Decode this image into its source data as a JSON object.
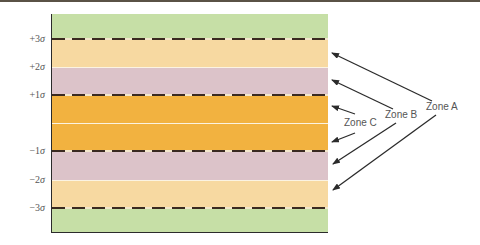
{
  "diagram": {
    "type": "control-chart-zones",
    "colors": {
      "outer": "#c6dfa6",
      "zone_a": "#f7d9a1",
      "zone_b": "#dcc3c9",
      "zone_c": "#f2b240",
      "dashed_line": "#3a2a20",
      "text": "#555555"
    },
    "y_labels": [
      {
        "prefix": "+3",
        "sigma": "σ"
      },
      {
        "prefix": "+2",
        "sigma": "σ"
      },
      {
        "prefix": "+1",
        "sigma": "σ"
      },
      {
        "prefix": "−1",
        "sigma": "σ"
      },
      {
        "prefix": "−2",
        "sigma": "σ"
      },
      {
        "prefix": "−3",
        "sigma": "σ"
      }
    ],
    "zones": [
      {
        "label": "Zone A"
      },
      {
        "label": "Zone B"
      },
      {
        "label": "Zone C"
      }
    ]
  }
}
